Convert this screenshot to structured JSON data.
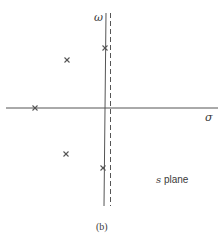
{
  "figure": {
    "caption": "(b)",
    "plane_label_var": "s",
    "plane_label_text": " plane",
    "axes": {
      "horizontal_label": "σ",
      "vertical_label": "ω"
    },
    "colors": {
      "line": "#555555",
      "text": "#3a3a3a",
      "background": "#ffffff"
    },
    "poles": [
      {
        "x": 105,
        "y": 48
      },
      {
        "x": 67,
        "y": 60
      },
      {
        "x": 35,
        "y": 108
      },
      {
        "x": 66,
        "y": 154
      },
      {
        "x": 103,
        "y": 168
      }
    ]
  }
}
